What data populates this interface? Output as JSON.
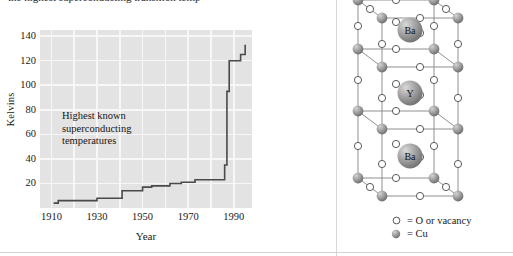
{
  "figure": {
    "clipped_caption": "the highest superconducting transition temp",
    "divider_color": "#d8d8d8"
  },
  "chart_data": {
    "type": "line",
    "step": true,
    "title": "",
    "xlabel": "Year",
    "ylabel": "Kelvins",
    "xlim": [
      1905,
      1998
    ],
    "ylim": [
      0,
      145
    ],
    "xticks": [
      1910,
      1930,
      1950,
      1970,
      1990
    ],
    "yticks": [
      20,
      40,
      60,
      80,
      100,
      120,
      140
    ],
    "grid": true,
    "grid_color": "#f7f7f7",
    "plot_bg": "#e3e3e3",
    "line_color": "#4a4a4a",
    "annotation": "Highest known superconducting temperatures",
    "annotation_lines": [
      "Highest known",
      "superconducting",
      "temperatures"
    ],
    "x": [
      1911,
      1913,
      1930,
      1941,
      1950,
      1954,
      1960,
      1967,
      1971,
      1973,
      1980,
      1986,
      1987,
      1988,
      1989,
      1993,
      1995
    ],
    "values": [
      4,
      6,
      8,
      10,
      14,
      15,
      17,
      18,
      20,
      21,
      22,
      35,
      52,
      95,
      96,
      120,
      133
    ],
    "series": [
      {
        "name": "Highest known superconducting temperature",
        "points": [
          {
            "year": 1911,
            "kelvins": 4
          },
          {
            "year": 1913,
            "kelvins": 6
          },
          {
            "year": 1930,
            "kelvins": 8
          },
          {
            "year": 1941,
            "kelvins": 14
          },
          {
            "year": 1950,
            "kelvins": 17
          },
          {
            "year": 1954,
            "kelvins": 18
          },
          {
            "year": 1962,
            "kelvins": 20
          },
          {
            "year": 1967,
            "kelvins": 21
          },
          {
            "year": 1973,
            "kelvins": 23
          },
          {
            "year": 1986,
            "kelvins": 35
          },
          {
            "year": 1987,
            "kelvins": 52
          },
          {
            "year": 1987,
            "kelvins": 95
          },
          {
            "year": 1988,
            "kelvins": 120
          },
          {
            "year": 1993,
            "kelvins": 125
          },
          {
            "year": 1995,
            "kelvins": 133
          }
        ]
      }
    ]
  },
  "crystal": {
    "title": "",
    "atom_labels": [
      "Ba",
      "Y",
      "Ba"
    ],
    "legend": [
      {
        "glyph": "open-circle",
        "label": "= O or vacancy"
      },
      {
        "glyph": "filled-sphere",
        "label": "= Cu"
      }
    ],
    "colors": {
      "sphere_gray": "#9a9a9a",
      "open_circle_stroke": "#555555",
      "bond_line": "#8a8a8a"
    }
  }
}
